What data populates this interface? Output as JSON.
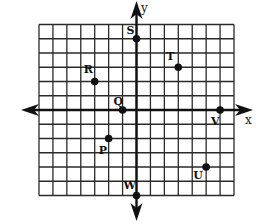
{
  "figure": {
    "type": "coordinate-plane",
    "grid": {
      "x_min": -7,
      "x_max": 7,
      "y_min": -6,
      "y_max": 6,
      "origin_px": [
        136.5,
        110
      ],
      "unit_x_px": 13.93,
      "unit_y_px": 14.25
    },
    "axes": {
      "x_label": "x",
      "y_label": "y"
    },
    "points": [
      {
        "label": "S",
        "x": 0,
        "y": 5,
        "label_dx": -10,
        "label_dy": -5
      },
      {
        "label": "T",
        "x": 3,
        "y": 3,
        "label_dx": -12,
        "label_dy": -7
      },
      {
        "label": "R",
        "x": -3,
        "y": 2,
        "label_dx": -11,
        "label_dy": -9
      },
      {
        "label": "Q",
        "x": -1,
        "y": 0,
        "label_dx": -9,
        "label_dy": -5
      },
      {
        "label": "P",
        "x": -2,
        "y": -2,
        "label_dx": -10,
        "label_dy": 15
      },
      {
        "label": "V",
        "x": 6,
        "y": 0,
        "label_dx": -9,
        "label_dy": 15
      },
      {
        "label": "U",
        "x": 5,
        "y": -4,
        "label_dx": -13,
        "label_dy": 12
      },
      {
        "label": "W",
        "x": 0,
        "y": -6,
        "label_dx": -13,
        "label_dy": -7
      }
    ],
    "colors": {
      "ink": "#111111",
      "background": "#ffffff"
    }
  }
}
